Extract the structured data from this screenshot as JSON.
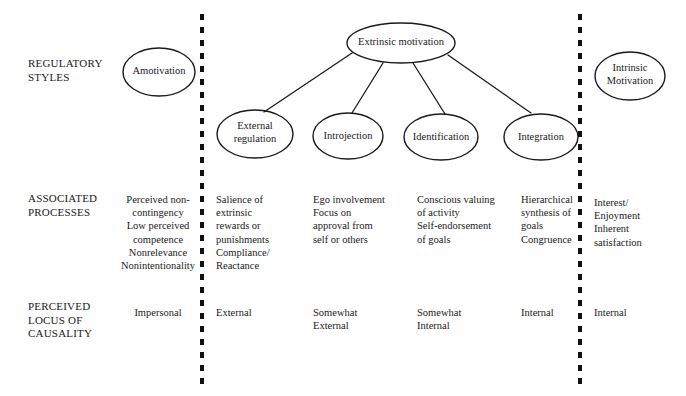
{
  "diagram": {
    "stroke_color": "#1a1a1a",
    "background_color": "#ffffff"
  },
  "row_labels": [
    {
      "id": "regulatory-styles",
      "text": "REGULATORY\nSTYLES"
    },
    {
      "id": "associated-processes",
      "text": "ASSOCIATED\nPROCESSES"
    },
    {
      "id": "perceived-locus",
      "text": "PERCEIVED\nLOCUS OF\nCAUSALITY"
    }
  ],
  "nodes": [
    {
      "id": "amotivation",
      "label": "Amotivation"
    },
    {
      "id": "extrinsic-motivation",
      "label": "Extrinsic motivation"
    },
    {
      "id": "external-regulation",
      "label": "External\nregulation"
    },
    {
      "id": "introjection",
      "label": "Introjection"
    },
    {
      "id": "identification",
      "label": "Identification"
    },
    {
      "id": "integration",
      "label": "Integration"
    },
    {
      "id": "intrinsic-motivation",
      "label": "Intrinsic\nMotivation"
    }
  ],
  "associated_processes": [
    {
      "id": "amotivation",
      "text": "Perceived non-\ncontingency\nLow perceived\ncompetence\nNonrelevance\nNonintentionality"
    },
    {
      "id": "external-regulation",
      "text": "Salience of\n   extrinsic\n   rewards or\n   punishments\nCompliance/\nReactance"
    },
    {
      "id": "introjection",
      "text": "Ego involvement\nFocus on\n  approval from\n  self or others"
    },
    {
      "id": "identification",
      "text": "Conscious valuing\nof activity\nSelf-endorsement\nof goals"
    },
    {
      "id": "integration",
      "text": "Hierarchical\nsynthesis of\ngoals\nCongruence"
    },
    {
      "id": "intrinsic-motivation",
      "text": "Interest/\nEnjoyment\nInherent\nsatisfaction"
    }
  ],
  "perceived_locus": [
    {
      "id": "amotivation",
      "text": "Impersonal"
    },
    {
      "id": "external-regulation",
      "text": "External"
    },
    {
      "id": "introjection",
      "text": "Somewhat\nExternal"
    },
    {
      "id": "identification",
      "text": "Somewhat\nInternal"
    },
    {
      "id": "integration",
      "text": "Internal"
    },
    {
      "id": "intrinsic-motivation",
      "text": "Internal"
    }
  ],
  "dividers": [
    {
      "id": "left-divider",
      "x": 202
    },
    {
      "id": "right-divider",
      "x": 580
    }
  ]
}
